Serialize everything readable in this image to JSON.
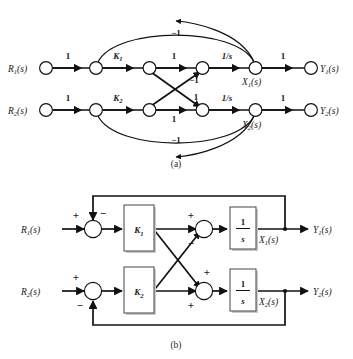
{
  "figure": {
    "caption_a": "(a)",
    "caption_b": "(b)",
    "stroke_color": "#111111",
    "block_border_color": "#555555",
    "background": "#ffffff"
  },
  "signal_flow_graph": {
    "name": "signal-flow-graph",
    "inputs": [
      {
        "id": "r1",
        "label": "R",
        "sub": "1",
        "suffix": "(s)"
      },
      {
        "id": "r2",
        "label": "R",
        "sub": "2",
        "suffix": "(s)"
      }
    ],
    "outputs": [
      {
        "id": "y1",
        "label": "Y",
        "sub": "1",
        "suffix": "(s)"
      },
      {
        "id": "y2",
        "label": "Y",
        "sub": "2",
        "suffix": "(s)"
      }
    ],
    "state_nodes": [
      {
        "id": "x1",
        "label": "X",
        "sub": "1",
        "suffix": "(s)"
      },
      {
        "id": "x2",
        "label": "X",
        "sub": "2",
        "suffix": "(s)"
      }
    ],
    "branch_gains": {
      "r1_to_sum1": "1",
      "sum1_to_k1": "K",
      "sum1_to_k1_sub": "1",
      "k1_out_to_sum2": "1",
      "sum2_to_x1": "1/s",
      "x1_to_y1": "1",
      "r2_to_sum3": "1",
      "sum3_to_k2": "K",
      "sum3_to_k2_sub": "2",
      "k2_out_to_sum4": "1",
      "sum4_to_x2": "1/s",
      "x2_to_y2": "1",
      "cross_up": "−1",
      "cross_down": "1",
      "feedback_top": "−1",
      "feedback_bottom": "−1"
    }
  },
  "block_diagram": {
    "name": "block-diagram",
    "inputs": [
      {
        "id": "r1",
        "label": "R",
        "sub": "1",
        "suffix": "(s)"
      },
      {
        "id": "r2",
        "label": "R",
        "sub": "2",
        "suffix": "(s)"
      }
    ],
    "outputs": [
      {
        "id": "y1",
        "label": "Y",
        "sub": "1",
        "suffix": "(s)"
      },
      {
        "id": "y2",
        "label": "Y",
        "sub": "2",
        "suffix": "(s)"
      }
    ],
    "state_labels": [
      {
        "id": "x1",
        "label": "X",
        "sub": "1",
        "suffix": "(s)"
      },
      {
        "id": "x2",
        "label": "X",
        "sub": "2",
        "suffix": "(s)"
      }
    ],
    "blocks": [
      {
        "id": "k1",
        "label": "K",
        "sub": "1"
      },
      {
        "id": "k2",
        "label": "K",
        "sub": "2"
      },
      {
        "id": "int1",
        "numerator": "1",
        "denominator": "s"
      },
      {
        "id": "int2",
        "numerator": "1",
        "denominator": "s"
      }
    ],
    "summing_junctions": [
      {
        "id": "sum1",
        "signs": {
          "left": "+",
          "top": "−"
        }
      },
      {
        "id": "sum2",
        "signs": {
          "left": "+",
          "diag": "−"
        }
      },
      {
        "id": "sum3",
        "signs": {
          "left": "+",
          "bottom": "−"
        }
      },
      {
        "id": "sum4",
        "signs": {
          "diag": "+",
          "left": "+"
        }
      }
    ]
  }
}
